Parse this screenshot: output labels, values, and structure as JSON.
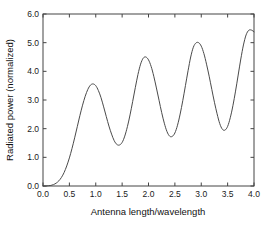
{
  "chart_data": {
    "type": "line",
    "title": "",
    "xlabel": "Antenna length/wavelength",
    "ylabel": "Radiated power (normalized)",
    "xlim": [
      0.0,
      4.0
    ],
    "ylim": [
      0.0,
      6.0
    ],
    "grid": false,
    "legend": null,
    "xticks": [
      "0.0",
      "0.5",
      "1.0",
      "1.5",
      "2.0",
      "2.5",
      "3.0",
      "3.5",
      "4.0"
    ],
    "xtick_values": [
      0.0,
      0.5,
      1.0,
      1.5,
      2.0,
      2.5,
      3.0,
      3.5,
      4.0
    ],
    "yticks": [
      "0.0",
      "1.0",
      "2.0",
      "3.0",
      "4.0",
      "5.0",
      "6.0"
    ],
    "ytick_values": [
      0.0,
      1.0,
      2.0,
      3.0,
      4.0,
      5.0,
      6.0
    ],
    "line_color": "#4a4a4a",
    "axis_color": "#444444",
    "background_color": "#ffffff",
    "features": {
      "peaks": [
        {
          "x": 0.92,
          "y": 3.56
        },
        {
          "x": 1.93,
          "y": 4.5
        },
        {
          "x": 2.93,
          "y": 5.0
        },
        {
          "x": 3.95,
          "y": 5.44
        }
      ],
      "troughs": [
        {
          "x": 1.38,
          "y": 1.43
        },
        {
          "x": 2.4,
          "y": 1.74
        },
        {
          "x": 3.42,
          "y": 1.95
        }
      ],
      "onset_x": 0.15
    },
    "x": [
      0.0,
      0.05,
      0.1,
      0.15,
      0.2,
      0.25,
      0.3,
      0.35,
      0.4,
      0.45,
      0.5,
      0.55,
      0.6,
      0.65,
      0.7,
      0.75,
      0.8,
      0.85,
      0.9,
      0.95,
      1.0,
      1.05,
      1.1,
      1.15,
      1.2,
      1.25,
      1.3,
      1.35,
      1.4,
      1.45,
      1.5,
      1.55,
      1.6,
      1.65,
      1.7,
      1.75,
      1.8,
      1.85,
      1.9,
      1.95,
      2.0,
      2.05,
      2.1,
      2.15,
      2.2,
      2.25,
      2.3,
      2.35,
      2.4,
      2.45,
      2.5,
      2.55,
      2.6,
      2.65,
      2.7,
      2.75,
      2.8,
      2.85,
      2.9,
      2.95,
      3.0,
      3.05,
      3.1,
      3.15,
      3.2,
      3.25,
      3.3,
      3.35,
      3.4,
      3.45,
      3.5,
      3.55,
      3.6,
      3.65,
      3.7,
      3.75,
      3.8,
      3.85,
      3.9,
      3.95,
      4.0
    ],
    "y": [
      0.0,
      0.0,
      0.01,
      0.02,
      0.05,
      0.1,
      0.18,
      0.3,
      0.47,
      0.7,
      0.98,
      1.31,
      1.68,
      2.07,
      2.46,
      2.82,
      3.13,
      3.37,
      3.52,
      3.56,
      3.5,
      3.33,
      3.08,
      2.76,
      2.42,
      2.09,
      1.81,
      1.58,
      1.45,
      1.43,
      1.52,
      1.74,
      2.07,
      2.48,
      2.95,
      3.43,
      3.89,
      4.25,
      4.46,
      4.5,
      4.4,
      4.17,
      3.83,
      3.42,
      2.99,
      2.56,
      2.19,
      1.9,
      1.74,
      1.73,
      1.85,
      2.12,
      2.51,
      2.98,
      3.5,
      4.02,
      4.5,
      4.84,
      4.99,
      5.0,
      4.88,
      4.62,
      4.25,
      3.83,
      3.37,
      2.92,
      2.52,
      2.18,
      1.98,
      1.95,
      2.08,
      2.38,
      2.8,
      3.31,
      3.87,
      4.43,
      4.92,
      5.27,
      5.43,
      5.44,
      5.38
    ]
  }
}
